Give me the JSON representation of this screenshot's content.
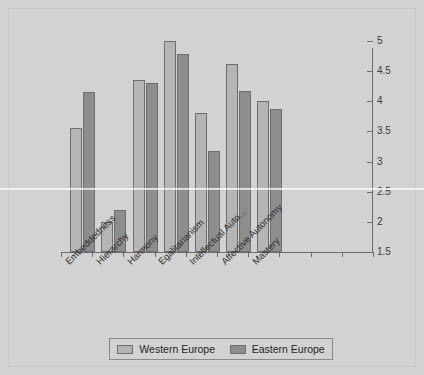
{
  "chart_data": {
    "type": "bar",
    "title": "",
    "xlabel": "",
    "ylabel": "",
    "ylim": [
      1.5,
      5
    ],
    "yticks": [
      "1.5",
      "2",
      "2.5",
      "3",
      "3.5",
      "4",
      "4.5",
      "5"
    ],
    "grid": false,
    "legend_position": "bottom",
    "categories": [
      "Embeddedness",
      "Hierarchy",
      "Harmony",
      "Egalitarianism",
      "Intellectual Auto...",
      "Affective Autonomy",
      "Mastery"
    ],
    "series": [
      {
        "name": "Western Europe",
        "color": "#b5b5b5",
        "values": [
          3.55,
          2.0,
          4.35,
          5.0,
          3.8,
          4.62,
          4.0
        ]
      },
      {
        "name": "Eastern Europe",
        "color": "#8d8d8d",
        "values": [
          4.15,
          2.2,
          4.3,
          4.78,
          3.18,
          4.17,
          3.87
        ]
      }
    ]
  },
  "legend": {
    "entries": [
      {
        "label": "Western Europe"
      },
      {
        "label": "Eastern Europe"
      }
    ]
  },
  "colors": {
    "background": "#d2d2d2",
    "axis": "#6b6b6b",
    "western": "#b5b5b5",
    "eastern": "#8d8d8d",
    "text": "#2f2f2f"
  }
}
